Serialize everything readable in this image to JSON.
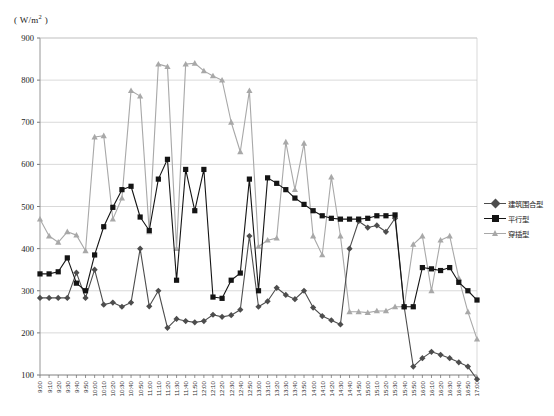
{
  "axis": {
    "y_unit_label": "( W/m2 )",
    "y_unit_prefix": "( W/m",
    "y_unit_sup": "2",
    "y_unit_suffix": " )"
  },
  "legend": {
    "items": [
      {
        "label": "建筑围合型",
        "color": "#4d4d4d",
        "marker": "diamond"
      },
      {
        "label": "平行型",
        "color": "#141414",
        "marker": "square"
      },
      {
        "label": "穿插型",
        "color": "#a8a8a8",
        "marker": "triangle"
      }
    ]
  },
  "caption": {
    "text": ""
  },
  "chart_data": {
    "type": "line",
    "title": "",
    "xlabel": "",
    "ylabel": "( W/m2 )",
    "ylim": [
      0,
      900
    ],
    "yticks": [
      100,
      200,
      300,
      400,
      500,
      600,
      700,
      800,
      900
    ],
    "grid": true,
    "legend_position": "right",
    "categories": [
      "9:00",
      "9:10",
      "9:20",
      "9:30",
      "9:40",
      "9:50",
      "10:00",
      "10:10",
      "10:20",
      "10:30",
      "10:40",
      "10:50",
      "11:00",
      "11:10",
      "11:20",
      "11:30",
      "11:40",
      "11:50",
      "12:00",
      "12:10",
      "12:20",
      "12:30",
      "12:40",
      "12:50",
      "13:00",
      "13:10",
      "13:20",
      "13:30",
      "13:40",
      "13:50",
      "14:00",
      "14:10",
      "14:20",
      "14:30",
      "14:40",
      "14:50",
      "15:00",
      "15:10",
      "15:20",
      "15:30",
      "15:40",
      "15:50",
      "16:00",
      "16:10",
      "16:20",
      "16:30",
      "16:40",
      "16:50",
      "17:00"
    ],
    "series": [
      {
        "name": "建筑围合型",
        "color": "#4d4d4d",
        "marker": "diamond",
        "values": [
          283,
          283,
          283,
          283,
          343,
          283,
          350,
          267,
          272,
          262,
          272,
          400,
          263,
          300,
          212,
          233,
          228,
          225,
          228,
          243,
          238,
          242,
          255,
          430,
          262,
          275,
          307,
          290,
          280,
          300,
          260,
          240,
          230,
          220,
          400,
          465,
          450,
          455,
          440,
          472,
          262,
          120,
          140,
          155,
          148,
          140,
          130,
          120,
          90
        ]
      },
      {
        "name": "平行型",
        "color": "#141414",
        "marker": "square",
        "values": [
          340,
          340,
          345,
          378,
          318,
          300,
          385,
          452,
          498,
          540,
          548,
          475,
          443,
          565,
          612,
          325,
          588,
          490,
          588,
          285,
          282,
          325,
          342,
          565,
          300,
          568,
          555,
          540,
          520,
          505,
          490,
          478,
          472,
          470,
          470,
          470,
          472,
          478,
          478,
          480,
          262,
          262,
          355,
          352,
          348,
          355,
          320,
          300,
          278
        ]
      },
      {
        "name": "穿插型",
        "color": "#a8a8a8",
        "marker": "triangle",
        "values": [
          470,
          430,
          415,
          440,
          432,
          395,
          665,
          668,
          470,
          520,
          775,
          762,
          440,
          838,
          832,
          400,
          838,
          840,
          822,
          810,
          800,
          700,
          630,
          775,
          405,
          420,
          425,
          653,
          540,
          650,
          430,
          385,
          570,
          430,
          250,
          250,
          248,
          252,
          252,
          262,
          262,
          410,
          430,
          300,
          420,
          430,
          330,
          250,
          185
        ]
      }
    ]
  }
}
